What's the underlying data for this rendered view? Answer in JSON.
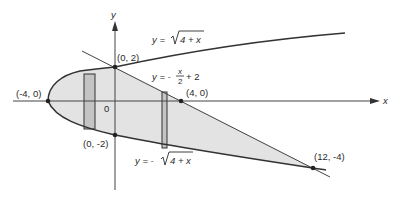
{
  "diagram": {
    "axes": {
      "x_label": "x",
      "y_label": "y",
      "origin_label": "0"
    },
    "curves": {
      "upper": {
        "label_prefix": "y = ",
        "label_radicand": "4 + x"
      },
      "lower": {
        "label_prefix": "y = -",
        "label_radicand": "4 + x"
      },
      "line": {
        "label_prefix": "y = -",
        "frac_num": "x",
        "frac_den": "2",
        "label_suffix": "+ 2"
      }
    },
    "points": [
      {
        "label": "(0, 2)",
        "x": 0,
        "y": 2
      },
      {
        "label": "(-4, 0)",
        "x": -4,
        "y": 0
      },
      {
        "label": "(4, 0)",
        "x": 4,
        "y": 0
      },
      {
        "label": "(0, -2)",
        "x": 0,
        "y": -2
      },
      {
        "label": "(12, -4)",
        "x": 12,
        "y": -4
      }
    ],
    "colors": {
      "region_fill": "#e3e3e3",
      "strip_fill": "#c4c4c4",
      "stroke": "#333333"
    }
  }
}
